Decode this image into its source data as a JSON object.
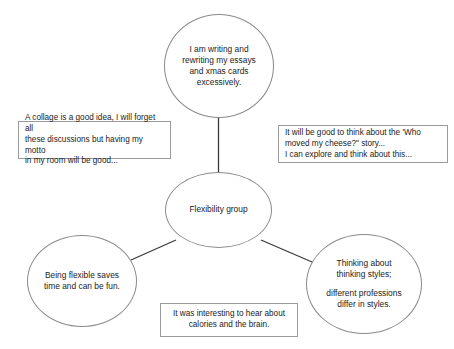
{
  "diagram": {
    "type": "mind-map",
    "title": "Flexibility group",
    "center": {
      "id": "center",
      "label": "Flexibility group",
      "shape": "ellipse"
    },
    "branches": [
      {
        "id": "top",
        "shape": "ellipse",
        "lines": [
          "I am writing and",
          "rewriting my essays",
          "and xmas cards",
          "excessively."
        ]
      },
      {
        "id": "bottom-left",
        "shape": "ellipse",
        "lines": [
          "Being flexible saves",
          "time and can be fun."
        ]
      },
      {
        "id": "bottom-right",
        "shape": "ellipse",
        "lines": [
          "Thinking about",
          "thinking styles;",
          "",
          "different professions",
          "differ in styles."
        ]
      }
    ],
    "notes": [
      {
        "id": "note-left",
        "shape": "rectangle",
        "align": "left",
        "lines": [
          "A collage is a good idea, I will forget all",
          "these discussions but having my motto",
          "in my room will be good..."
        ]
      },
      {
        "id": "note-right",
        "shape": "rectangle",
        "align": "left",
        "lines": [
          "It will be good to think about the 'Who",
          "moved my cheese?\" story...",
          "I can explore and think about this..."
        ]
      },
      {
        "id": "note-bottom",
        "shape": "rectangle",
        "align": "center",
        "lines": [
          "It was interesting to hear about",
          "calories and the brain."
        ]
      }
    ],
    "connectors": [
      {
        "from": "center",
        "to": "top"
      },
      {
        "from": "center",
        "to": "bottom-left"
      },
      {
        "from": "center",
        "to": "bottom-right"
      }
    ],
    "colors": {
      "background": "#ffffff",
      "ellipse_stroke": "#8a8a8a",
      "box_stroke": "#9a9a9a",
      "connector_stroke": "#3a3a3a",
      "text": "#1b1b1b"
    }
  }
}
